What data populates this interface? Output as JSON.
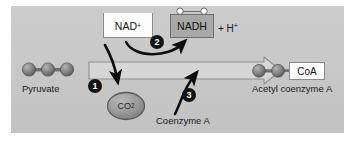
{
  "figure": {
    "panel_background": "#c7c7c7",
    "page_background": "#ffffff"
  },
  "molecules": {
    "pyruvate": {
      "label": "Pyruvate",
      "carbon_count": 3,
      "sphere_color": "#8a8a8a"
    },
    "acetyl_coa": {
      "label": "Acetyl coenzyme A",
      "carbon_count": 2,
      "tag_label": "CoA",
      "sphere_color": "#8a8a8a"
    },
    "co2": {
      "label": "CO",
      "subscript": "2",
      "fill": "#9e9e9e",
      "stroke": "#5c5c5c"
    },
    "coenzyme_a": {
      "label": "Coenzyme A"
    }
  },
  "cofactors": {
    "nad_plus": {
      "label": "NAD",
      "superscript": "+",
      "fill": "#fdfdfd",
      "stroke": "#8d8d8d",
      "notches": 2
    },
    "nadh": {
      "label": "NADH",
      "fill": "#a8a8a8",
      "stroke": "#6f6f6f",
      "electrons": 2
    },
    "proton": {
      "label": "+ H",
      "superscript": "+"
    }
  },
  "steps": [
    {
      "number": "1",
      "description": "decarboxylation releasing CO2"
    },
    {
      "number": "2",
      "description": "NAD+ reduced to NADH + H+"
    },
    {
      "number": "3",
      "description": "coenzyme A attachment"
    }
  ],
  "main_arrow": {
    "direction": "right",
    "style": "hollow-block-arrow",
    "fill": "#d6d6d6",
    "stroke": "#8f8f8f"
  },
  "colors": {
    "text": "#1a1a1a",
    "badge": "#141414",
    "badge_text": "#ffffff",
    "curve_arrow": "#0d0d0d"
  }
}
